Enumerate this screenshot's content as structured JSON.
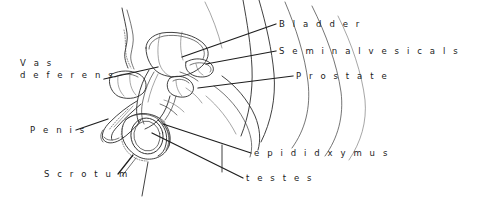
{
  "figure": {
    "background_color": "#ffffff",
    "ink_color": "#2b2b2b",
    "width": 478,
    "height": 202
  },
  "labels": {
    "vas_deferens_line1": "V a s",
    "vas_deferens_line2": "d e f e r e n s",
    "penis": "P e n i s",
    "scrotum": "S c r o t u m",
    "bladder": "B l a d d e r",
    "seminal_vesicals": "S e m i n a l   v e s i c a l s",
    "prostate": "P r o s t a t e",
    "epididxymus": "e p i d i d x y m u s",
    "testes": "t e s t e s"
  },
  "annotations": [
    {
      "name": "vas-deferens",
      "text": "Vas deferens",
      "side": "left"
    },
    {
      "name": "penis",
      "text": "Penis",
      "side": "left"
    },
    {
      "name": "scrotum",
      "text": "Scrotum",
      "side": "left"
    },
    {
      "name": "bladder",
      "text": "Bladder",
      "side": "right"
    },
    {
      "name": "seminal-vesicals",
      "text": "Seminal vesicals",
      "side": "right"
    },
    {
      "name": "prostate",
      "text": "Prostate",
      "side": "right"
    },
    {
      "name": "epididxymus",
      "text": "epididxymus",
      "side": "right"
    },
    {
      "name": "testes",
      "text": "testes",
      "side": "right"
    }
  ]
}
